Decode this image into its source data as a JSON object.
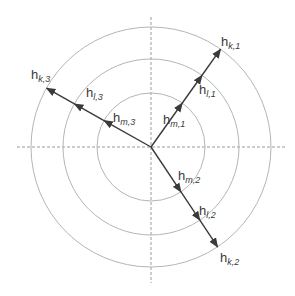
{
  "diagram": {
    "type": "polar-vector-diagram",
    "center": {
      "x": 151,
      "y": 147
    },
    "rings": [
      {
        "name": "inner-ring",
        "radius": 54
      },
      {
        "name": "middle-ring",
        "radius": 88
      },
      {
        "name": "outer-ring",
        "radius": 120
      }
    ],
    "axes": {
      "style": "dashed",
      "horizontal_extent": [
        17,
        285
      ],
      "vertical_extent": [
        17,
        283
      ]
    },
    "colors": {
      "ring": "#b5b5b5",
      "axis": "#9a9a9a",
      "arrow": "#3a3a3a",
      "text": "#3a3a3a"
    },
    "vectors": [
      {
        "name": "vector-1",
        "angle_unit": [
          0.58,
          -0.815
        ],
        "labels": [
          {
            "id": "h_m1",
            "main": "h",
            "sub": "m,1",
            "x": 163,
            "y": 124
          },
          {
            "id": "h_l1",
            "main": "h",
            "sub": "l,1",
            "x": 199,
            "y": 94
          },
          {
            "id": "h_k1",
            "main": "h",
            "sub": "k,1",
            "x": 221,
            "y": 46
          }
        ]
      },
      {
        "name": "vector-2",
        "angle_unit": [
          0.555,
          0.832
        ],
        "labels": [
          {
            "id": "h_m2",
            "main": "h",
            "sub": "m,2",
            "x": 178,
            "y": 180
          },
          {
            "id": "h_l2",
            "main": "h",
            "sub": "l,2",
            "x": 199,
            "y": 215
          },
          {
            "id": "h_k2",
            "main": "h",
            "sub": "k,2",
            "x": 220,
            "y": 262
          }
        ]
      },
      {
        "name": "vector-3",
        "angle_unit": [
          -0.87,
          -0.49
        ],
        "labels": [
          {
            "id": "h_m3",
            "main": "h",
            "sub": "m,3",
            "x": 113,
            "y": 122
          },
          {
            "id": "h_l3",
            "main": "h",
            "sub": "l,3",
            "x": 86,
            "y": 97
          },
          {
            "id": "h_k3",
            "main": "h",
            "sub": "k,3",
            "x": 31,
            "y": 79
          }
        ]
      }
    ]
  }
}
